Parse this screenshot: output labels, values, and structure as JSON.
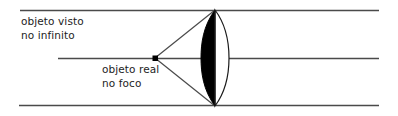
{
  "figure": {
    "background_color": "#ffffff",
    "width": 398,
    "height": 116
  },
  "labels": {
    "upper": {
      "name": "objeto-visto-no-infinito",
      "line1": "objeto visto",
      "line2": "no infinito",
      "color": "#1d1d1d",
      "x": 21,
      "y": 14
    },
    "lower": {
      "name": "objeto-real-no-foco",
      "line1": "objeto real",
      "line2": "no foco",
      "color": "#1d1d1d",
      "x": 102,
      "y": 62
    }
  },
  "colors": {
    "ray_line": "#4a4a4a",
    "axis_line": "#4a4a4a",
    "lens_outline": "#1a1a1a",
    "lens_fill_left": "#000000",
    "lens_fill_right": "#ffffff",
    "focal_point": "#000000",
    "text": "#1d1d1d"
  },
  "geometry": {
    "top_ray": {
      "x1": 20,
      "y1": 10,
      "x2": 379,
      "y2": 10
    },
    "optical_axis": {
      "x1": 58,
      "y1": 58,
      "x2": 379,
      "y2": 58
    },
    "bottom_ray": {
      "x1": 19,
      "y1": 106,
      "x2": 379,
      "y2": 106
    },
    "focal_point": {
      "cx": 155,
      "cy": 58,
      "size": 5
    },
    "cone_upper": {
      "x1": 155,
      "y1": 58,
      "x2": 215,
      "y2": 10
    },
    "cone_lower": {
      "x1": 155,
      "y1": 58,
      "x2": 215,
      "y2": 106
    },
    "lens": {
      "top_vertex": {
        "x": 215,
        "y": 10
      },
      "bottom_vertex": {
        "x": 215,
        "y": 106
      },
      "left_bulge_x": 201,
      "right_bulge_x": 229,
      "center_x": 215
    }
  },
  "elements": {
    "top_ray_name": "parallel-ray-top",
    "bottom_ray_name": "parallel-ray-bottom",
    "axis_name": "optical-axis",
    "lens_name": "converging-lens",
    "lens_left_name": "lens-left-half-filled",
    "lens_right_name": "lens-right-half-outline",
    "point_name": "focal-point-marker",
    "cone_name": "ray-cone-from-focus"
  }
}
